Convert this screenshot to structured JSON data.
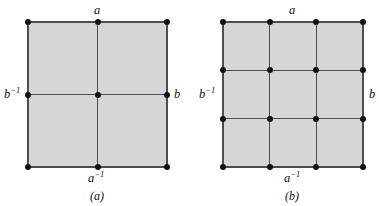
{
  "figure": {
    "background_color": "#ffffff",
    "fill_color": "#d6d6d6",
    "line_color": "#4d4d4d",
    "vertex_color": "#111111",
    "width": 379,
    "height": 206
  },
  "panels": [
    {
      "id": "a",
      "caption": "(a)",
      "rows": 2,
      "cols": 2,
      "labels": {
        "top": "a",
        "bottom_base": "a",
        "bottom_exponent": "−1",
        "left_base": "b",
        "left_exponent": "−1",
        "right": "b"
      },
      "square": {
        "x": 28,
        "y": 22,
        "width": 139,
        "height": 145
      },
      "x_lines": [
        28,
        97.5,
        167
      ],
      "y_lines": [
        22,
        94.5,
        167
      ]
    },
    {
      "id": "b",
      "caption": "(b)",
      "rows": 3,
      "cols": 3,
      "labels": {
        "top": "a",
        "bottom_base": "a",
        "bottom_exponent": "−1",
        "left_base": "b",
        "left_exponent": "−1",
        "right": "b"
      },
      "square": {
        "x": 223,
        "y": 22,
        "width": 140,
        "height": 145
      },
      "x_lines": [
        223,
        269.7,
        316.3,
        363
      ],
      "y_lines": [
        22,
        70.3,
        118.7,
        167
      ]
    }
  ],
  "label_text": {
    "panel_a_top": "a",
    "panel_a_bottom_base": "a",
    "panel_a_bottom_sup": "−1",
    "panel_a_left_base": "b",
    "panel_a_left_sup": "−1",
    "panel_a_right": "b",
    "panel_a_caption": "(a)",
    "panel_b_top": "a",
    "panel_b_bottom_base": "a",
    "panel_b_bottom_sup": "−1",
    "panel_b_left_base": "b",
    "panel_b_left_sup": "−1",
    "panel_b_right": "b",
    "panel_b_caption": "(b)"
  }
}
